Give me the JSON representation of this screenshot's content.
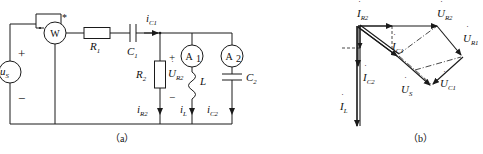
{
  "figure": {
    "caption_a": "（a）",
    "caption_b": "（b）"
  },
  "circuit": {
    "source": {
      "label": "u",
      "sub": "S",
      "plus": "+",
      "minus": "−"
    },
    "wattmeter": {
      "label": "W",
      "star_current": "*",
      "star_voltage": "*",
      "dot": "∙"
    },
    "components": [
      {
        "name": "resistor-r1",
        "label": "R",
        "sub": "1"
      },
      {
        "name": "capacitor-c1",
        "label": "C",
        "sub": "1"
      },
      {
        "name": "resistor-r2",
        "label": "R",
        "sub": "2"
      },
      {
        "name": "inductor-l",
        "label": "L",
        "sub": ""
      },
      {
        "name": "capacitor-c2",
        "label": "C",
        "sub": "2"
      }
    ],
    "meters": [
      {
        "name": "ammeter-a1",
        "label": "A",
        "sub": "1"
      },
      {
        "name": "ammeter-a2",
        "label": "A",
        "sub": "2"
      }
    ],
    "currents": [
      {
        "name": "current-ic1",
        "label": "i",
        "sub": "C1"
      },
      {
        "name": "current-ir2",
        "label": "i",
        "sub": "R2"
      },
      {
        "name": "current-il",
        "label": "i",
        "sub": "L"
      },
      {
        "name": "current-ic2",
        "label": "i",
        "sub": "C2"
      }
    ],
    "voltages": [
      {
        "name": "voltage-ur2",
        "label": "U",
        "sub": "R2",
        "dot": true,
        "plus": "+",
        "minus": "−"
      }
    ]
  },
  "phasor": {
    "vectors": [
      {
        "name": "phasor-ir2",
        "label": "I",
        "sub": "R2",
        "dot": true
      },
      {
        "name": "phasor-ur2",
        "label": "U",
        "sub": "R2",
        "dot": true
      },
      {
        "name": "phasor-ur1",
        "label": "U",
        "sub": "R1",
        "dot": true
      },
      {
        "name": "phasor-ic1",
        "label": "I",
        "sub": "C1",
        "dot": true
      },
      {
        "name": "phasor-ic2",
        "label": "I",
        "sub": "C2",
        "dot": true
      },
      {
        "name": "phasor-us",
        "label": "U",
        "sub": "S",
        "dot": true
      },
      {
        "name": "phasor-uc1",
        "label": "U",
        "sub": "C1",
        "dot": true
      },
      {
        "name": "phasor-il",
        "label": "I",
        "sub": "L",
        "dot": true
      }
    ]
  }
}
